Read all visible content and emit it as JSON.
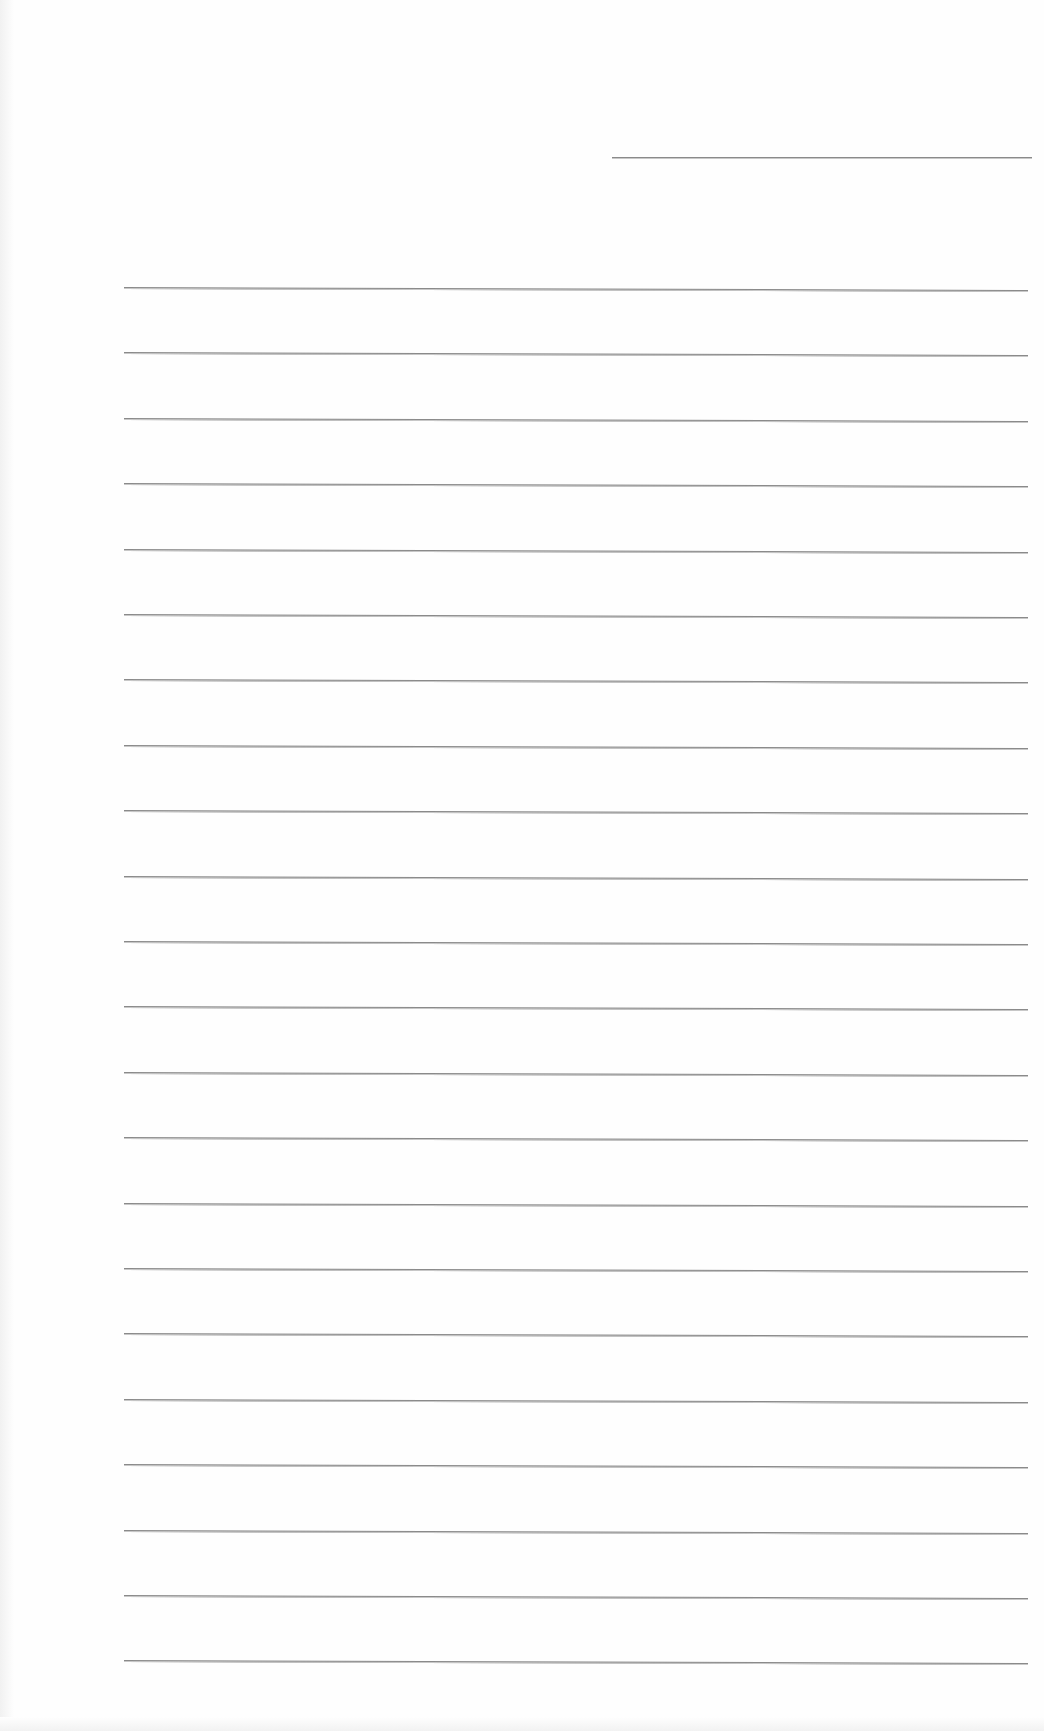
{
  "page": {
    "type": "blank lined sheet",
    "background_color": "#fefefe",
    "line_color": "#8a8a8a"
  },
  "header_line": {
    "x1": 612,
    "x2": 1032,
    "y": 157
  },
  "ruled_lines": {
    "count": 22,
    "x1": 124,
    "x2": 1028,
    "first_y": 287,
    "spacing": 65.4,
    "slope_px": 3
  },
  "text_content": []
}
